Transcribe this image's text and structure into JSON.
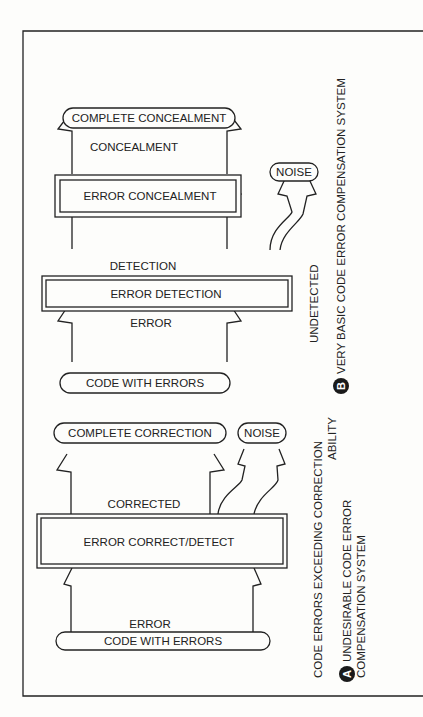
{
  "diagram_a": {
    "badge": "A",
    "caption_line1": "UNDESIRABLE CODE  ERROR",
    "caption_line2": "COMPENSATION SYSTEM",
    "side_note_line1": "CODE ERRORS EXCEEDING CORRECTION",
    "side_note_line2": "ABILITY",
    "output_node": "COMPLETE  CORRECTION",
    "noise_node": "NOISE",
    "flow_label_top": "CORRECTED",
    "process_box": "ERROR CORRECT/DETECT",
    "flow_label_bottom": "ERROR",
    "input_node": "CODE  WITH  ERRORS"
  },
  "diagram_b": {
    "badge": "B",
    "caption": "VERY BASIC CODE ERROR COMPENSATION  SYSTEM",
    "side_note": "UNDETECTED",
    "output_node": "COMPLETE  CONCEALMENT",
    "flow_label_concealment": "CONCEALMENT",
    "concealment_box": "ERROR CONCEALMENT",
    "noise_node": "NOISE",
    "flow_label_detection": "DETECTION",
    "detection_box": "ERROR DETECTION",
    "flow_label_error": "ERROR",
    "input_node": "CODE WITH ERRORS"
  },
  "colors": {
    "ink": "#222222",
    "paper": "#fdfdfb"
  }
}
